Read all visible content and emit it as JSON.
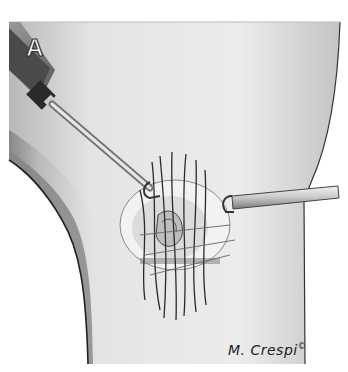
{
  "figure": {
    "panel_label": "A",
    "signature": "M. Crespi",
    "signature_mark": "©",
    "colors": {
      "background": "#ffffff",
      "skin_light": "#e6e6e6",
      "skin_shade": "#a8a8a8",
      "outline": "#2a2a2a",
      "instrument_dark": "#4a4a4a",
      "instrument_light": "#d8d8d8"
    }
  }
}
